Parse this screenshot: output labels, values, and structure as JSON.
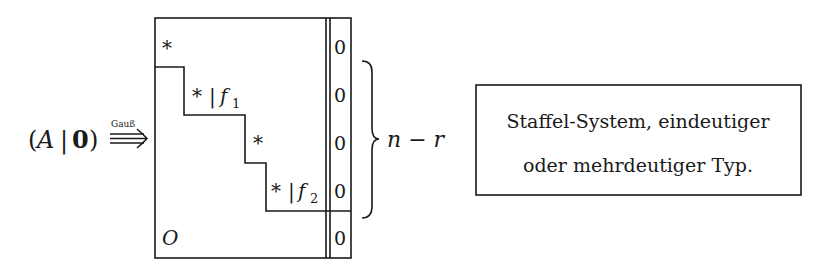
{
  "left_expression": {
    "open_paren": "(",
    "matrix": "A",
    "separator": "|",
    "zero_vector": "0",
    "close_paren": ")",
    "arrow_label": "Gauß",
    "arrow": "⟹"
  },
  "matrix_block": {
    "pivots": [
      {
        "symbol": "*",
        "suffix": ""
      },
      {
        "symbol": "*",
        "bar": "|",
        "var": "f",
        "sub": "1"
      },
      {
        "symbol": "*",
        "suffix": ""
      },
      {
        "symbol": "*",
        "bar": "|",
        "var": "f",
        "sub": "2"
      }
    ],
    "zero_block_label": "O",
    "rhs_column": [
      "0",
      "0",
      "0",
      "0",
      "0"
    ]
  },
  "brace_label": "n − r",
  "result_box": {
    "line1": "Staffel-System, eindeutiger",
    "line2": "oder mehrdeutiger Typ."
  }
}
